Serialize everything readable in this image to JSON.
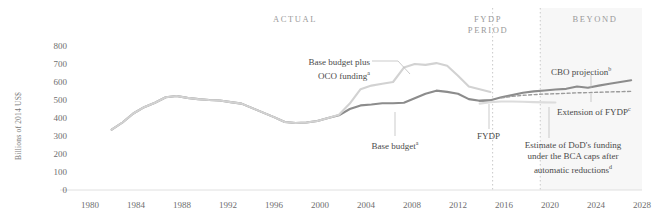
{
  "chart_data": {
    "type": "line",
    "title": "",
    "xlabel": "",
    "ylabel": "Billions of 2014 US$",
    "xlim": [
      1978,
      2029
    ],
    "ylim": [
      0,
      800
    ],
    "grid": false,
    "legend_position": "inline-annotations",
    "xticks": [
      1980,
      1984,
      1988,
      1992,
      1996,
      2000,
      2004,
      2008,
      2012,
      2016,
      2020,
      2024,
      2028
    ],
    "yticks": [
      0,
      100,
      200,
      300,
      400,
      500,
      600,
      700,
      800
    ],
    "series": [
      {
        "name": "Base budget",
        "color": "#8c8c8c",
        "style": "solid",
        "x": [
          1980,
          1981,
          1982,
          1983,
          1984,
          1985,
          1986,
          1987,
          1988,
          1989,
          1990,
          1991,
          1992,
          1993,
          1994,
          1995,
          1996,
          1997,
          1998,
          1999,
          2000,
          2001,
          2002,
          2003,
          2004,
          2005,
          2006,
          2007,
          2008,
          2009,
          2010,
          2011,
          2012,
          2013,
          2014,
          2015
        ],
        "values": [
          335,
          375,
          425,
          460,
          485,
          515,
          522,
          512,
          505,
          500,
          497,
          488,
          480,
          455,
          430,
          405,
          378,
          372,
          375,
          383,
          400,
          415,
          450,
          470,
          475,
          482,
          482,
          485,
          510,
          535,
          552,
          545,
          535,
          505,
          496,
          498
        ]
      },
      {
        "name": "Base budget plus OCO funding",
        "color": "#d2d2d2",
        "style": "solid",
        "x": [
          1980,
          1981,
          1982,
          1983,
          1984,
          1985,
          1986,
          1987,
          1988,
          1989,
          1990,
          1991,
          1992,
          1993,
          1994,
          1995,
          1996,
          1997,
          1998,
          1999,
          2000,
          2001,
          2002,
          2003,
          2004,
          2005,
          2006,
          2007,
          2008,
          2009,
          2010,
          2011,
          2012,
          2013,
          2014,
          2015
        ],
        "values": [
          335,
          375,
          425,
          460,
          485,
          515,
          522,
          512,
          505,
          500,
          497,
          488,
          480,
          455,
          430,
          405,
          378,
          372,
          375,
          383,
          400,
          418,
          480,
          560,
          580,
          590,
          600,
          680,
          700,
          695,
          705,
          690,
          635,
          575,
          560,
          545
        ]
      },
      {
        "name": "CBO projection",
        "color": "#8c8c8c",
        "style": "solid",
        "x": [
          2014,
          2015,
          2016,
          2017,
          2018,
          2019,
          2020,
          2021,
          2022,
          2023,
          2024,
          2025,
          2026,
          2027,
          2028
        ],
        "values": [
          496,
          498,
          515,
          527,
          540,
          548,
          553,
          558,
          562,
          575,
          568,
          580,
          590,
          600,
          610
        ]
      },
      {
        "name": "Extension of FYDP",
        "color": "#9b9b9b",
        "style": "dashed",
        "x": [
          2016,
          2017,
          2018,
          2019,
          2020,
          2021,
          2022,
          2023,
          2024,
          2025,
          2026,
          2027,
          2028
        ],
        "values": [
          512,
          520,
          526,
          530,
          533,
          535,
          537,
          540,
          541,
          543,
          545,
          546,
          548
        ]
      },
      {
        "name": "Estimate of DoD's funding under the BCA caps after automatic reductions",
        "color": "#dcdcdc",
        "style": "solid",
        "x": [
          2014,
          2015,
          2016,
          2017,
          2018,
          2019,
          2020,
          2021
        ],
        "values": [
          480,
          488,
          492,
          492,
          490,
          488,
          487,
          486
        ]
      }
    ],
    "bands": [
      {
        "id": "actual",
        "label": "ACTUAL",
        "from": 1978,
        "to": 2015.2,
        "shaded": false
      },
      {
        "id": "fydp-period",
        "label": "FYDP PERIOD",
        "from": 2015.2,
        "to": 2019.6,
        "shaded": false
      },
      {
        "id": "beyond",
        "label": "BEYOND",
        "from": 2019.6,
        "to": 2029,
        "shaded": true
      }
    ],
    "annotations": [
      {
        "id": "base-plus-oco",
        "text": "Base budget plus",
        "text2": "OCO funding",
        "sup": "a"
      },
      {
        "id": "base-budget",
        "text": "Base budget",
        "sup": "a"
      },
      {
        "id": "fydp",
        "text": "FYDP",
        "sup": ""
      },
      {
        "id": "cbo-projection",
        "text": "CBO projection",
        "sup": "b"
      },
      {
        "id": "extension-of-fydp",
        "text": "Extension of FYDP",
        "sup": "c"
      },
      {
        "id": "bca-estimate",
        "text": "Estimate of DoD's funding",
        "text2": "under the BCA caps after",
        "text3": "automatic reductions",
        "sup": "d"
      }
    ]
  },
  "labels": {
    "y_axis_title": "Billions of 2014 US$",
    "band_actual": "ACTUAL",
    "band_fydp_1": "FYDP",
    "band_fydp_2": "PERIOD",
    "band_beyond": "BEYOND",
    "ann_base_oco_l1": "Base budget plus",
    "ann_base_oco_l2": "OCO funding",
    "ann_base_oco_sup": "a",
    "ann_base_budget": "Base budget",
    "ann_base_budget_sup": "a",
    "ann_fydp": "FYDP",
    "ann_cbo": "CBO projection",
    "ann_cbo_sup": "b",
    "ann_ext_fydp": "Extension of FYDP",
    "ann_ext_fydp_sup": "c",
    "ann_bca_l1": "Estimate of DoD's funding",
    "ann_bca_l2": "under the BCA caps after",
    "ann_bca_l3": "automatic reductions",
    "ann_bca_sup": "d",
    "y0": "0",
    "y100": "100",
    "y200": "200",
    "y300": "300",
    "y400": "400",
    "y500": "500",
    "y600": "600",
    "y700": "700",
    "y800": "800",
    "x1980": "1980",
    "x1984": "1984",
    "x1988": "1988",
    "x1992": "1992",
    "x1996": "1996",
    "x2000": "2000",
    "x2004": "2004",
    "x2008": "2008",
    "x2012": "2012",
    "x2016": "2016",
    "x2020": "2020",
    "x2024": "2024",
    "x2028": "2028"
  }
}
